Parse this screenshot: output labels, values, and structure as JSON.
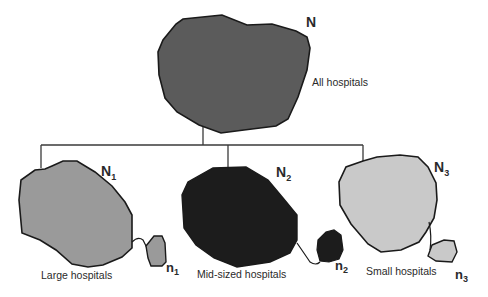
{
  "diagram": {
    "type": "tree",
    "root": {
      "symbol": "N",
      "label": "All hospitals",
      "fill": "#5b5b5b"
    },
    "children": [
      {
        "symbol": "N",
        "subscript": "1",
        "sample_symbol": "n",
        "sample_subscript": "1",
        "label": "Large hospitals",
        "fill": "#9a9a9a"
      },
      {
        "symbol": "N",
        "subscript": "2",
        "sample_symbol": "n",
        "sample_subscript": "2",
        "label": "Mid-sized hospitals",
        "fill": "#1c1c1c"
      },
      {
        "symbol": "N",
        "subscript": "3",
        "sample_symbol": "n",
        "sample_subscript": "3",
        "label": "Small hospitals",
        "fill": "#c9c9c9"
      }
    ],
    "colors": {
      "outline": "#1a1a1a",
      "connector": "#3a3a3a",
      "background": "#ffffff"
    }
  }
}
